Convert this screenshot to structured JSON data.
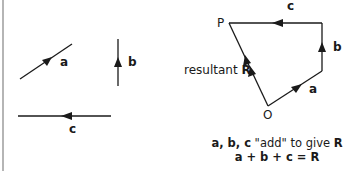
{
  "left_panel": {
    "vectors": [
      {
        "name": "a",
        "label": "a",
        "direction": "up-right"
      },
      {
        "name": "b",
        "label": "b",
        "direction": "up"
      },
      {
        "name": "c",
        "label": "c",
        "direction": "left"
      }
    ]
  },
  "right_panel": {
    "point_P": "P",
    "point_O": "O",
    "edge_labels": {
      "a": "a",
      "b": "b",
      "c": "c"
    },
    "resultant_prefix": "resultant ",
    "resultant_symbol": "R"
  },
  "caption": {
    "line1_vectors": "a, b, c",
    "line1_add": " \"add\" ",
    "line1_rest": "to give ",
    "line1_R": "R",
    "line2": "a + b + c = R"
  },
  "colors": {
    "line": "#1a1a1a",
    "border": "#b5b5b5"
  }
}
